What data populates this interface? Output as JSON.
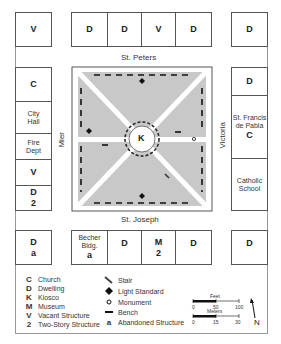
{
  "streets": {
    "north": "St. Peters",
    "south": "St. Joseph",
    "west": "Mier",
    "east": "Victoria"
  },
  "blocks": {
    "top_row": [
      {
        "code": "V",
        "name": ""
      },
      {
        "code": "D",
        "name": ""
      },
      {
        "code": "D",
        "name": ""
      },
      {
        "code": "V",
        "name": ""
      },
      {
        "code": "D",
        "name": ""
      },
      {
        "code": "D",
        "name": ""
      }
    ],
    "left_column": [
      {
        "code": "C",
        "name": "",
        "sub": ""
      },
      {
        "code": "",
        "name": "City Hall",
        "sub": ""
      },
      {
        "code": "",
        "name": "Fire Dept",
        "sub": ""
      },
      {
        "code": "V",
        "name": "",
        "sub": ""
      },
      {
        "code": "D",
        "name": "",
        "sub": "2"
      }
    ],
    "right_column": [
      {
        "code": "D",
        "name": ""
      },
      {
        "code": "C",
        "name": "St. Francis de Pabla"
      },
      {
        "code": "",
        "name": "Catholic School"
      }
    ],
    "bottom_row": [
      {
        "code": "D",
        "name": "",
        "sub": "a"
      },
      {
        "code": "",
        "name": "Becher Bldg.",
        "sub": "a"
      },
      {
        "code": "D",
        "name": "",
        "sub": ""
      },
      {
        "code": "M",
        "name": "",
        "sub": "2"
      },
      {
        "code": "D",
        "name": "",
        "sub": ""
      },
      {
        "code": "D",
        "name": "",
        "sub": ""
      }
    ]
  },
  "plaza": {
    "kiosk_label": "K",
    "fill_color": "#c8c8c8"
  },
  "legend": {
    "left": [
      {
        "symbol": "C",
        "label": "Church"
      },
      {
        "symbol": "D",
        "label": "Dwelling"
      },
      {
        "symbol": "K",
        "label": "Kiosco"
      },
      {
        "symbol": "M",
        "label": "Museum"
      },
      {
        "symbol": "V",
        "label": "Vacant Structure"
      },
      {
        "symbol": "2",
        "label": "Two-Story Structure"
      }
    ],
    "right": [
      {
        "symbol": "stair-icon",
        "label": "Stair"
      },
      {
        "symbol": "light-standard-icon",
        "label": "Light Standard"
      },
      {
        "symbol": "monument-icon",
        "label": "Monument"
      },
      {
        "symbol": "bench-icon",
        "label": "Bench"
      },
      {
        "symbol": "a",
        "label": "Abandoned Structure"
      }
    ]
  },
  "scale": {
    "feet_label": "Feet",
    "feet_ticks": [
      "0",
      "50",
      "100"
    ],
    "meters_label": "Meters",
    "meters_ticks": [
      "0",
      "15",
      "30"
    ],
    "north_label": "N"
  }
}
